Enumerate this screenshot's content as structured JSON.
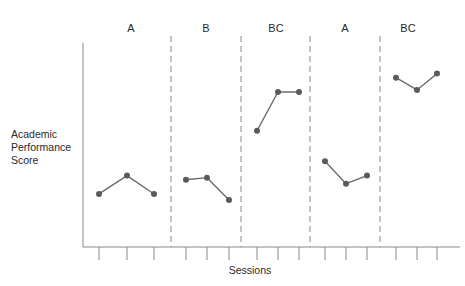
{
  "chart_data": {
    "type": "line",
    "title": "",
    "xlabel": "Sessions",
    "ylabel": "Academic Performance Score",
    "y_scale_note": "No numeric y-axis ticks shown; values are relative (0 = x-axis, 100 = top of y-axis)",
    "ylim": [
      0,
      100
    ],
    "grid": false,
    "legend": null,
    "phase_dividers": "dashed vertical lines between phases",
    "phases": [
      {
        "label": "A",
        "sessions": [
          1,
          2,
          3
        ],
        "values": [
          26,
          35,
          26
        ]
      },
      {
        "label": "B",
        "sessions": [
          4,
          5,
          6
        ],
        "values": [
          33,
          34,
          23
        ]
      },
      {
        "label": "BC",
        "sessions": [
          7,
          8,
          9
        ],
        "values": [
          57,
          76,
          76
        ]
      },
      {
        "label": "A",
        "sessions": [
          10,
          11,
          12
        ],
        "values": [
          42,
          31,
          35
        ]
      },
      {
        "label": "BC",
        "sessions": [
          13,
          14,
          15
        ],
        "values": [
          83,
          77,
          85
        ]
      }
    ],
    "x": [
      1,
      2,
      3,
      4,
      5,
      6,
      7,
      8,
      9,
      10,
      11,
      12,
      13,
      14,
      15
    ],
    "series": [
      {
        "name": "Academic Performance Score",
        "values": [
          26,
          35,
          26,
          33,
          34,
          23,
          57,
          76,
          76,
          42,
          31,
          35,
          83,
          77,
          85
        ]
      }
    ]
  },
  "labels": {
    "ylabel_lines": [
      "Academic",
      "Performance",
      "Score"
    ],
    "xlabel": "Sessions",
    "phases": [
      "A",
      "B",
      "BC",
      "A",
      "BC"
    ]
  },
  "colors": {
    "axis": "#8a8a8a",
    "line": "#6b6b6b",
    "point": "#5a5a5a",
    "divider": "#8a8a8a",
    "text": "#2a2a2a"
  }
}
